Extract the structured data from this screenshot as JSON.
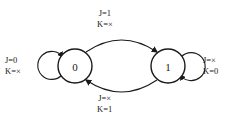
{
  "diagram": {
    "type": "state-transition-diagram",
    "background_color": "#ffffff",
    "line_color": "#1a1a1a",
    "states": [
      {
        "id": "s0",
        "label": "0",
        "cx": 75,
        "cy": 66,
        "r": 17
      },
      {
        "id": "s1",
        "label": "1",
        "cx": 168,
        "cy": 66,
        "r": 17
      }
    ],
    "transitions": [
      {
        "id": "t-0-to-1",
        "from": "0",
        "to": "1",
        "position": "top",
        "inputs": [
          {
            "var": "J",
            "eq": "=",
            "value": "1"
          },
          {
            "var": "K",
            "eq": "=",
            "value": "×"
          }
        ],
        "line1": "J=1",
        "line2": "K=×"
      },
      {
        "id": "t-1-to-0",
        "from": "1",
        "to": "0",
        "position": "bottom",
        "inputs": [
          {
            "var": "J",
            "eq": "=",
            "value": "×"
          },
          {
            "var": "K",
            "eq": "=",
            "value": "1"
          }
        ],
        "line1": "J=×",
        "line2": "K=1"
      },
      {
        "id": "t-0-self",
        "from": "0",
        "to": "0",
        "position": "left",
        "inputs": [
          {
            "var": "J",
            "eq": "=",
            "value": "0"
          },
          {
            "var": "K",
            "eq": "=",
            "value": "×"
          }
        ],
        "line1": "J=0",
        "line2": "K=×"
      },
      {
        "id": "t-1-self",
        "from": "1",
        "to": "1",
        "position": "right",
        "inputs": [
          {
            "var": "J",
            "eq": "=",
            "value": "×"
          },
          {
            "var": "K",
            "eq": "=",
            "value": "0"
          }
        ],
        "line1": "J=×",
        "line2": "K=0"
      }
    ]
  }
}
